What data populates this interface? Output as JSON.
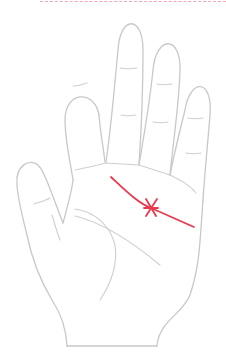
{
  "illustration": {
    "subject": "palm-hand-outline",
    "highlighted_line": "head-line",
    "marking": "cross-mark",
    "colors": {
      "outline": "#c8c8c8",
      "highlight": "#e8394d",
      "background": "#ffffff",
      "top_rule": "#f2a7b3"
    }
  }
}
